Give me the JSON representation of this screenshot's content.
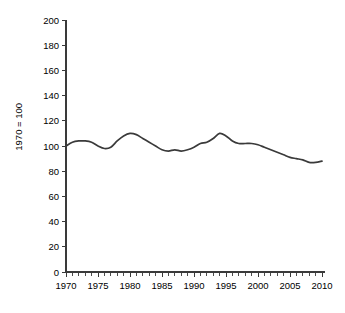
{
  "chart_data": {
    "type": "line",
    "title": "",
    "xlabel": "",
    "ylabel": "1970 = 100",
    "xlim": [
      1970,
      2010
    ],
    "ylim": [
      0,
      200
    ],
    "grid": false,
    "legend": false,
    "y_ticks": [
      0,
      20,
      40,
      60,
      80,
      100,
      120,
      140,
      160,
      180,
      200
    ],
    "y_tick_labels": [
      "0",
      "20",
      "40",
      "60",
      "80",
      "100",
      "120",
      "140",
      "160",
      "180",
      "200"
    ],
    "x_ticks": [
      1970,
      1975,
      1980,
      1985,
      1990,
      1995,
      2000,
      2005,
      2010
    ],
    "x_tick_labels": [
      "1970",
      "1975",
      "1980",
      "1985",
      "1990",
      "1995",
      "2000",
      "2005",
      "2010"
    ],
    "x_minor_tick_step": 1,
    "series": [
      {
        "name": "index",
        "color": "#3a3a3a",
        "x": [
          1970,
          1971,
          1972,
          1973,
          1974,
          1975,
          1976,
          1977,
          1978,
          1979,
          1980,
          1981,
          1982,
          1983,
          1984,
          1985,
          1986,
          1987,
          1988,
          1989,
          1990,
          1991,
          1992,
          1993,
          1994,
          1995,
          1996,
          1997,
          1998,
          1999,
          2000,
          2001,
          2002,
          2003,
          2004,
          2005,
          2006,
          2007,
          2008,
          2009,
          2010
        ],
        "values": [
          100,
          103,
          104,
          104,
          103,
          100,
          98,
          99,
          104,
          108,
          110,
          109,
          106,
          103,
          100,
          97,
          96,
          97,
          96,
          97,
          99,
          102,
          103,
          106,
          110,
          108,
          104,
          102,
          102,
          102,
          101,
          99,
          97,
          95,
          93,
          91,
          90,
          89,
          87,
          87,
          88
        ]
      }
    ]
  }
}
